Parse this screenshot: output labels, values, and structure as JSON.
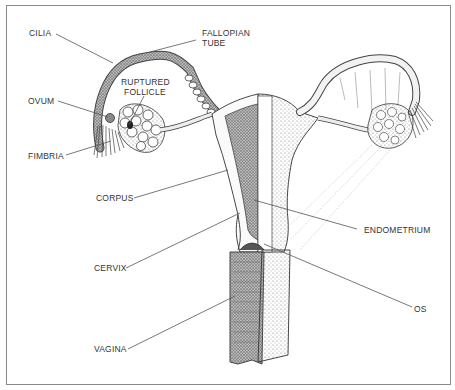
{
  "diagram": {
    "labels": {
      "cilia": "CILIA",
      "fallopian_tube_1": "FALLOPIAN",
      "fallopian_tube_2": "TUBE",
      "ruptured_follicle_1": "RUPTURED",
      "ruptured_follicle_2": "FOLLICLE",
      "ovum": "OVUM",
      "fimbria": "FIMBRIA",
      "corpus": "CORPUS",
      "cervix": "CERVIX",
      "vagina": "VAGINA",
      "endometrium": "ENDOMETRIUM",
      "os": "OS"
    },
    "colors": {
      "ink": "#333333",
      "leader": "#555555",
      "stipple": "#8a8a8a",
      "border": "#8a8a8a"
    }
  }
}
